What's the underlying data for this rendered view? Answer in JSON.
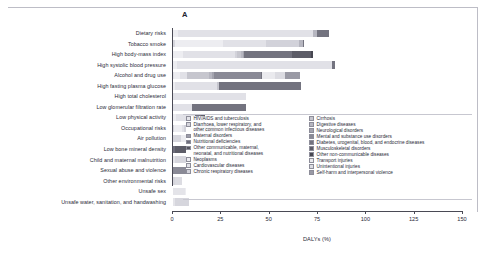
{
  "figure": {
    "panel_letter": "A"
  },
  "chart_data": {
    "type": "bar",
    "orientation": "horizontal",
    "stacked": true,
    "title": "",
    "xlabel": "DALYs (%)",
    "ylabel": "",
    "xlim": [
      0,
      150
    ],
    "xticks": [
      0,
      25,
      50,
      75,
      100,
      125,
      150
    ],
    "xticklabels": [
      "0",
      "25",
      "50",
      "75",
      "100",
      "125",
      "150"
    ],
    "grid": false,
    "legend_position": "inside-lower-right",
    "categories": [
      "Dietary risks",
      "Tobacco smoke",
      "High body-mass index",
      "High systolic blood pressure",
      "Alcohol and drug use",
      "High fasting plasma glucose",
      "High total cholesterol",
      "Low glomerular filtration rate",
      "Low physical activity",
      "Occupational risks",
      "Air pollution",
      "Low bone mineral density",
      "Child and maternal malnutrition",
      "Sexual abuse and violence",
      "Other environmental risks",
      "Unsafe sex",
      "Unsafe water, sanitation, and handwashing"
    ],
    "series": [
      {
        "name": "HIV/AIDS and tuberculosis",
        "color": "#e4e4e9",
        "values": [
          0,
          0,
          0,
          0,
          0.4,
          0,
          0,
          0,
          0,
          0,
          0,
          0,
          1.2,
          0,
          0,
          6.0,
          1.0
        ]
      },
      {
        "name": "Diarrhoea, lower respiratory, and other common infectious diseases",
        "color": "#d6d6dd",
        "values": [
          0,
          1.0,
          0,
          0,
          0,
          0,
          0,
          0,
          0,
          0.5,
          4.0,
          0,
          9.0,
          0,
          0.8,
          0,
          7.5
        ]
      },
      {
        "name": "Maternal disorders",
        "color": "#9c9ca8",
        "values": [
          0,
          0,
          0,
          0,
          0,
          0,
          0,
          0,
          0,
          0,
          0,
          0,
          0.6,
          0,
          0,
          0,
          0
        ]
      },
      {
        "name": "Nutritional deficiencies",
        "color": "#6e6e7c",
        "values": [
          0,
          0,
          0,
          0,
          0,
          0,
          0,
          0,
          0,
          0,
          0,
          1.0,
          6.5,
          0,
          0,
          0,
          0
        ]
      },
      {
        "name": "Other communicable, maternal, neonatal, and nutritional diseases",
        "color": "#55555f",
        "values": [
          0,
          0,
          0,
          0,
          0,
          0,
          0,
          0,
          0,
          0,
          0,
          0,
          2.0,
          0,
          0,
          0,
          0
        ]
      },
      {
        "name": "Neoplasms",
        "color": "#ededf1",
        "values": [
          2.5,
          25.0,
          5.0,
          2.0,
          3.0,
          1.0,
          0,
          0,
          1.5,
          4.0,
          5.0,
          0,
          0,
          0,
          0,
          1.0,
          0
        ]
      },
      {
        "name": "Cardiovascular diseases",
        "color": "#e1e1e7",
        "values": [
          70.0,
          22.0,
          27.0,
          80.0,
          4.0,
          22.0,
          38.0,
          10.0,
          10.0,
          1.0,
          16.0,
          0,
          0,
          0,
          0,
          0,
          0
        ]
      },
      {
        "name": "Chronic respiratory diseases",
        "color": "#d2d2da",
        "values": [
          0,
          17.0,
          1.0,
          0,
          0,
          0,
          0,
          0,
          0,
          6.0,
          9.0,
          0,
          0,
          0,
          0,
          0,
          0
        ]
      },
      {
        "name": "Cirrhosis",
        "color": "#c6c6ce",
        "values": [
          0,
          0,
          2.0,
          0,
          11.0,
          1.0,
          0,
          0,
          0,
          0,
          0,
          0,
          0,
          0,
          0,
          0,
          0
        ]
      },
      {
        "name": "Digestive diseases",
        "color": "#b6b6c0",
        "values": [
          2.0,
          2.0,
          1.0,
          0,
          2.0,
          0,
          0,
          0,
          0,
          0.5,
          0,
          0,
          0,
          0,
          0,
          0,
          0
        ]
      },
      {
        "name": "Neurological disorders",
        "color": "#a3a3ae",
        "values": [
          0,
          0,
          0.5,
          0,
          1.0,
          0,
          0,
          0,
          0,
          0,
          0,
          0,
          0,
          0,
          0,
          0,
          0
        ]
      },
      {
        "name": "Mental and substance use disorders",
        "color": "#8a8a96",
        "values": [
          0,
          0,
          0,
          0,
          24.0,
          0,
          0,
          0,
          0,
          0,
          0,
          0,
          0,
          11.0,
          0,
          0,
          0
        ]
      },
      {
        "name": "Diabetes, urogenital, blood, and endocrine diseases",
        "color": "#73737f",
        "values": [
          6.0,
          1.0,
          25.0,
          2.0,
          0.5,
          42.0,
          0,
          28.0,
          3.0,
          0.5,
          0,
          0,
          0,
          0,
          0,
          0,
          0
        ]
      },
      {
        "name": "Musculoskeletal disorders",
        "color": "#5d5d68",
        "values": [
          0,
          0,
          10.0,
          0,
          0,
          0,
          0,
          0,
          2.0,
          9.0,
          0,
          5.5,
          0,
          0,
          0,
          0,
          0
        ]
      },
      {
        "name": "Other non-communicable diseases",
        "color": "#474751",
        "values": [
          0,
          0,
          1.0,
          0,
          0,
          0,
          0,
          0,
          0,
          1.0,
          0,
          0,
          0,
          0,
          0,
          0,
          0
        ]
      },
      {
        "name": "Transport injuries",
        "color": "#eaeaee",
        "values": [
          0,
          0,
          0,
          0,
          7.0,
          0,
          0,
          0,
          0,
          2.0,
          0,
          0,
          0,
          0,
          0,
          0,
          0
        ]
      },
      {
        "name": "Unintentional injuries",
        "color": "#dcdce2",
        "values": [
          0,
          0,
          0,
          0,
          5.0,
          0,
          0,
          0,
          0,
          7.0,
          0,
          7.0,
          0,
          0,
          4.0,
          0,
          0
        ]
      },
      {
        "name": "Self-harm and interpersonal violence",
        "color": "#9a9aa5",
        "values": [
          0,
          0,
          0,
          0,
          8.0,
          0,
          0,
          0,
          0,
          0,
          0,
          0,
          0,
          8.0,
          0,
          0,
          0
        ]
      }
    ],
    "totals": [
      80.5,
      68.0,
      72.5,
      84.0,
      65.9,
      66.0,
      38.0,
      38.0,
      16.5,
      31.5,
      34.0,
      13.5,
      19.3,
      19.0,
      4.8,
      7.0,
      8.5
    ]
  },
  "legend": {
    "left_column": [
      "HIV/AIDS and tuberculosis",
      "Diarrhoea, lower respiratory, and\nother common infectious diseases",
      "Maternal disorders",
      "Nutritional deficiencies",
      "Other communicable, maternal,\nneonatal, and nutritional diseases",
      "Neoplasms",
      "Cardiovascular diseases",
      "Chronic respiratory diseases"
    ],
    "right_column": [
      "Cirrhosis",
      "Digestive diseases",
      "Neurological disorders",
      "Mental and substance use disorders",
      "Diabetes, urogenital, blood, and endocrine diseases",
      "Musculoskeletal disorders",
      "Other non-communicable diseases",
      "Transport injuries",
      "Unintentional injuries",
      "Self-harm and interpersonal violence"
    ]
  }
}
